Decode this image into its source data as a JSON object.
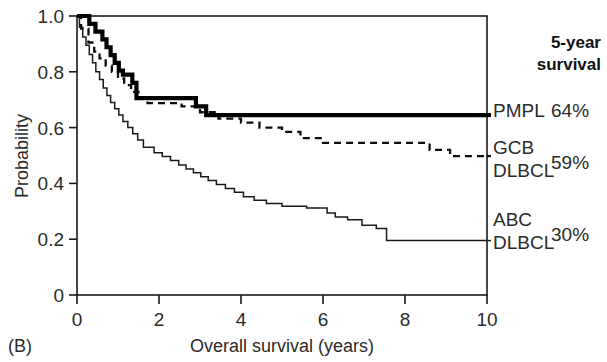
{
  "panel": {
    "label": "(B)"
  },
  "axes": {
    "x": {
      "title": "Overall survival (years)",
      "ticks": [
        "0",
        "2",
        "4",
        "6",
        "8",
        "10"
      ],
      "min": 0,
      "max": 10
    },
    "y": {
      "title": "Probability",
      "ticks": [
        "1.0",
        "0.8",
        "0.6",
        "0.4",
        "0.2",
        "0"
      ],
      "min": 0,
      "max": 1.0
    }
  },
  "legend": {
    "header_line1": "5-year",
    "header_line2": "survival",
    "entries": [
      {
        "name": "PMPL",
        "name_line2": "",
        "value": "64%",
        "style": "thick-solid"
      },
      {
        "name": "GCB",
        "name_line2": "DLBCL",
        "value": "59%",
        "style": "dashed"
      },
      {
        "name": "ABC",
        "name_line2": "DLBCL",
        "value": "30%",
        "style": "thin-solid"
      }
    ]
  },
  "chart_data": {
    "type": "line",
    "subtype": "kaplan-meier-step",
    "title": "",
    "xlabel": "Overall survival (years)",
    "ylabel": "Probability",
    "xlim": [
      0,
      10
    ],
    "ylim": [
      0,
      1.0
    ],
    "xticks": [
      0,
      2,
      4,
      6,
      8,
      10
    ],
    "yticks": [
      0,
      0.2,
      0.4,
      0.6,
      0.8,
      1.0
    ],
    "grid": false,
    "legend_position": "right-outside",
    "annotations": [
      "5-year survival: PMPL 64%, GCB DLBCL 59%, ABC DLBCL 30%"
    ],
    "series": [
      {
        "name": "PMPL",
        "style": "thick-solid",
        "five_year_survival": "64%",
        "points": [
          [
            0.0,
            1.0
          ],
          [
            0.3,
            1.0
          ],
          [
            0.3,
            0.972
          ],
          [
            0.45,
            0.972
          ],
          [
            0.45,
            0.944
          ],
          [
            0.62,
            0.944
          ],
          [
            0.62,
            0.916
          ],
          [
            0.72,
            0.916
          ],
          [
            0.72,
            0.888
          ],
          [
            0.82,
            0.888
          ],
          [
            0.82,
            0.86
          ],
          [
            0.92,
            0.86
          ],
          [
            0.92,
            0.832
          ],
          [
            1.02,
            0.832
          ],
          [
            1.02,
            0.804
          ],
          [
            1.12,
            0.804
          ],
          [
            1.12,
            0.79
          ],
          [
            1.35,
            0.79
          ],
          [
            1.35,
            0.76
          ],
          [
            1.45,
            0.76
          ],
          [
            1.45,
            0.706
          ],
          [
            2.9,
            0.706
          ],
          [
            2.9,
            0.676
          ],
          [
            3.15,
            0.676
          ],
          [
            3.15,
            0.645
          ],
          [
            10.0,
            0.645
          ]
        ]
      },
      {
        "name": "GCB DLBCL",
        "style": "dashed",
        "five_year_survival": "59%",
        "points": [
          [
            0.0,
            1.0
          ],
          [
            0.1,
            1.0
          ],
          [
            0.1,
            0.955
          ],
          [
            0.28,
            0.955
          ],
          [
            0.28,
            0.905
          ],
          [
            0.42,
            0.905
          ],
          [
            0.42,
            0.872
          ],
          [
            0.55,
            0.872
          ],
          [
            0.55,
            0.848
          ],
          [
            0.7,
            0.848
          ],
          [
            0.7,
            0.822
          ],
          [
            0.85,
            0.822
          ],
          [
            0.85,
            0.8
          ],
          [
            1.0,
            0.8
          ],
          [
            1.0,
            0.776
          ],
          [
            1.15,
            0.776
          ],
          [
            1.15,
            0.752
          ],
          [
            1.32,
            0.752
          ],
          [
            1.32,
            0.728
          ],
          [
            1.5,
            0.728
          ],
          [
            1.5,
            0.706
          ],
          [
            1.72,
            0.706
          ],
          [
            1.72,
            0.688
          ],
          [
            2.55,
            0.688
          ],
          [
            2.55,
            0.676
          ],
          [
            3.0,
            0.676
          ],
          [
            3.0,
            0.655
          ],
          [
            3.45,
            0.655
          ],
          [
            3.45,
            0.632
          ],
          [
            4.0,
            0.632
          ],
          [
            4.0,
            0.618
          ],
          [
            4.45,
            0.618
          ],
          [
            4.45,
            0.6
          ],
          [
            5.0,
            0.6
          ],
          [
            5.0,
            0.585
          ],
          [
            5.45,
            0.585
          ],
          [
            5.45,
            0.562
          ],
          [
            6.0,
            0.562
          ],
          [
            6.0,
            0.545
          ],
          [
            8.6,
            0.545
          ],
          [
            8.6,
            0.52
          ],
          [
            9.1,
            0.52
          ],
          [
            9.1,
            0.498
          ],
          [
            10.0,
            0.498
          ]
        ]
      },
      {
        "name": "ABC DLBCL",
        "style": "thin-solid",
        "five_year_survival": "30%",
        "points": [
          [
            0.0,
            1.0
          ],
          [
            0.06,
            1.0
          ],
          [
            0.06,
            0.96
          ],
          [
            0.14,
            0.96
          ],
          [
            0.14,
            0.925
          ],
          [
            0.22,
            0.925
          ],
          [
            0.22,
            0.895
          ],
          [
            0.3,
            0.895
          ],
          [
            0.3,
            0.862
          ],
          [
            0.38,
            0.862
          ],
          [
            0.38,
            0.832
          ],
          [
            0.46,
            0.832
          ],
          [
            0.46,
            0.8
          ],
          [
            0.55,
            0.8
          ],
          [
            0.55,
            0.772
          ],
          [
            0.64,
            0.772
          ],
          [
            0.64,
            0.742
          ],
          [
            0.73,
            0.742
          ],
          [
            0.73,
            0.715
          ],
          [
            0.82,
            0.715
          ],
          [
            0.82,
            0.69
          ],
          [
            0.92,
            0.69
          ],
          [
            0.92,
            0.668
          ],
          [
            1.02,
            0.668
          ],
          [
            1.02,
            0.645
          ],
          [
            1.12,
            0.645
          ],
          [
            1.12,
            0.622
          ],
          [
            1.24,
            0.622
          ],
          [
            1.24,
            0.6
          ],
          [
            1.36,
            0.6
          ],
          [
            1.36,
            0.578
          ],
          [
            1.48,
            0.578
          ],
          [
            1.48,
            0.556
          ],
          [
            1.62,
            0.556
          ],
          [
            1.62,
            0.53
          ],
          [
            1.88,
            0.53
          ],
          [
            1.88,
            0.51
          ],
          [
            2.08,
            0.51
          ],
          [
            2.08,
            0.496
          ],
          [
            2.28,
            0.496
          ],
          [
            2.28,
            0.482
          ],
          [
            2.48,
            0.482
          ],
          [
            2.48,
            0.466
          ],
          [
            2.66,
            0.466
          ],
          [
            2.66,
            0.452
          ],
          [
            2.84,
            0.452
          ],
          [
            2.84,
            0.438
          ],
          [
            3.02,
            0.438
          ],
          [
            3.02,
            0.424
          ],
          [
            3.2,
            0.424
          ],
          [
            3.2,
            0.41
          ],
          [
            3.4,
            0.41
          ],
          [
            3.4,
            0.396
          ],
          [
            3.62,
            0.396
          ],
          [
            3.62,
            0.382
          ],
          [
            3.84,
            0.382
          ],
          [
            3.84,
            0.368
          ],
          [
            4.06,
            0.368
          ],
          [
            4.06,
            0.352
          ],
          [
            4.32,
            0.352
          ],
          [
            4.32,
            0.34
          ],
          [
            4.62,
            0.34
          ],
          [
            4.62,
            0.328
          ],
          [
            5.0,
            0.328
          ],
          [
            5.0,
            0.318
          ],
          [
            5.6,
            0.318
          ],
          [
            5.6,
            0.312
          ],
          [
            6.1,
            0.312
          ],
          [
            6.1,
            0.294
          ],
          [
            6.3,
            0.294
          ],
          [
            6.3,
            0.28
          ],
          [
            6.6,
            0.28
          ],
          [
            6.6,
            0.27
          ],
          [
            6.95,
            0.27
          ],
          [
            6.95,
            0.25
          ],
          [
            7.3,
            0.25
          ],
          [
            7.3,
            0.238
          ],
          [
            7.55,
            0.238
          ],
          [
            7.55,
            0.195
          ],
          [
            10.0,
            0.195
          ]
        ]
      }
    ]
  }
}
